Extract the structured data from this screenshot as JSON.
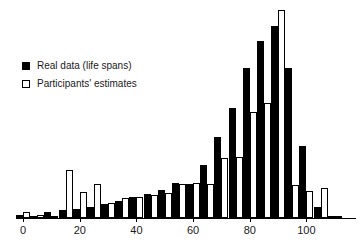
{
  "chart_data": {
    "type": "bar",
    "title": "",
    "subtitle": "",
    "xlabel": "",
    "ylabel": "",
    "xlim": [
      -2.5,
      117.5
    ],
    "ylim": [
      0,
      100
    ],
    "grid": false,
    "legend_position": "upper-left",
    "bin_width": 5,
    "categories": [
      0,
      5,
      10,
      15,
      20,
      25,
      30,
      35,
      40,
      45,
      50,
      55,
      60,
      65,
      70,
      75,
      80,
      85,
      90,
      95,
      100,
      105,
      110,
      115
    ],
    "xticks": [
      0,
      20,
      40,
      60,
      80,
      100
    ],
    "xticklabels": [
      "0",
      "20",
      "40",
      "60",
      "80",
      "100"
    ],
    "series": [
      {
        "name": "Real data (life spans)",
        "color": "#000000",
        "style": "filled",
        "values": [
          1.5,
          1.0,
          3.0,
          4.0,
          4.5,
          5.5,
          6.5,
          8.0,
          10.0,
          11.5,
          13.5,
          17.0,
          16.5,
          25.5,
          39.0,
          53.0,
          72.0,
          85.0,
          92.5,
          72.0,
          34.5,
          5.5,
          0.5,
          0.0
        ]
      },
      {
        "name": "Participants' estimates",
        "color": "#ffffff",
        "style": "hollow",
        "values": [
          3.0,
          1.5,
          1.0,
          23.0,
          12.5,
          16.5,
          7.0,
          9.5,
          10.0,
          11.0,
          12.0,
          16.5,
          17.0,
          16.5,
          29.0,
          29.5,
          51.0,
          55.5,
          100.0,
          16.0,
          13.0,
          14.5,
          1.0,
          0.0
        ]
      }
    ]
  },
  "legend": {
    "items": [
      {
        "label": "Real data (life spans)",
        "swatch": "filled-square"
      },
      {
        "label": "Participants' estimates",
        "swatch": "hollow-square"
      }
    ]
  }
}
